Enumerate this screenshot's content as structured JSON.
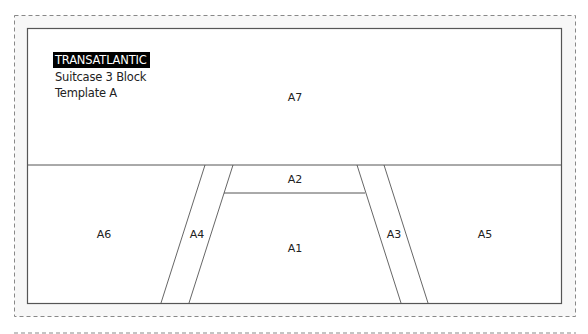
{
  "header": {
    "brand": "TRANSATLANTIC",
    "subtitle_line1": "Suitcase 3 Block",
    "subtitle_line2": "Template A"
  },
  "pieces": [
    {
      "id": "A7",
      "label": "A7"
    },
    {
      "id": "A6",
      "label": "A6"
    },
    {
      "id": "A4",
      "label": "A4"
    },
    {
      "id": "A2",
      "label": "A2"
    },
    {
      "id": "A1",
      "label": "A1"
    },
    {
      "id": "A3",
      "label": "A3"
    },
    {
      "id": "A5",
      "label": "A5"
    }
  ],
  "colors": {
    "line": "#555555",
    "dashed": "#888888",
    "title_bg": "#000000",
    "title_fg": "#ffffff"
  }
}
